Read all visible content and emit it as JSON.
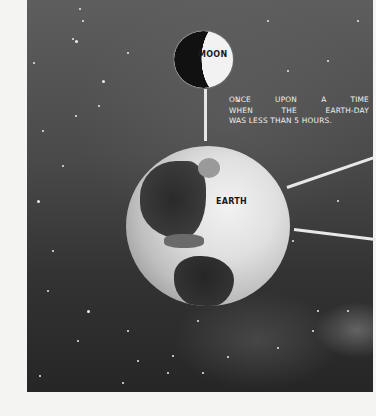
{
  "illustration": {
    "moon_label": "MOON",
    "earth_label": "EARTH",
    "caption_lines": [
      "ONCE UPON A TIME",
      "WHEN THE EARTH-DAY",
      "WAS LESS THAN 5 HOURS."
    ]
  },
  "colors": {
    "page_background": "#f4f4f2",
    "space_dark": "#2a2a2a",
    "space_light": "#5e5e5e",
    "text_light": "#f0f0f0",
    "text_dark": "#1a1a1a"
  }
}
